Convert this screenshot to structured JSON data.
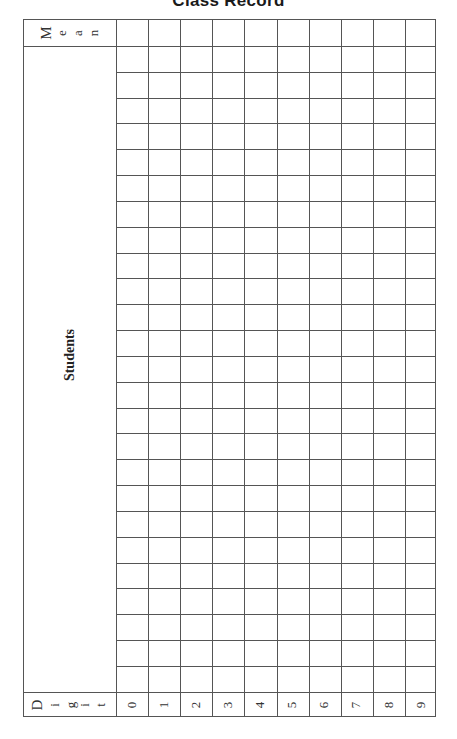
{
  "title": "Class Record",
  "table": {
    "mean_label": [
      "M",
      "e",
      "a",
      "n"
    ],
    "students_label": "Students",
    "digit_label": [
      "D",
      "i",
      "g",
      "i",
      "t"
    ],
    "digits": [
      "0",
      "1",
      "2",
      "3",
      "4",
      "5",
      "6",
      "7",
      "8",
      "9"
    ],
    "student_rows": 25
  }
}
